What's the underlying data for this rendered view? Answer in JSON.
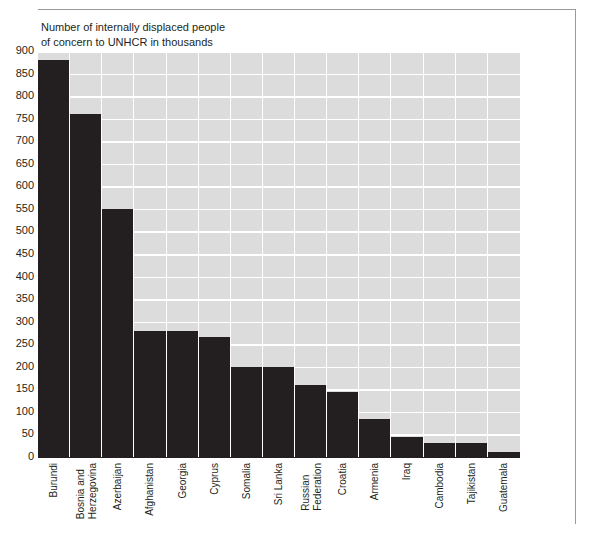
{
  "chart_data": {
    "type": "bar",
    "title": "Number of internally displaced people\nof concern to UNHCR in thousands",
    "xlabel": "",
    "ylabel": "",
    "ylim": [
      0,
      900
    ],
    "ytick_step": 50,
    "grid": true,
    "legend": "none",
    "orientation": "vertical",
    "bar_color": "#231f20",
    "plot_background": "#dcdcdc",
    "gridline_color": "#ffffff",
    "yticks": [
      "900",
      "850",
      "800",
      "750",
      "700",
      "650",
      "600",
      "550",
      "500",
      "450",
      "400",
      "350",
      "300",
      "250",
      "200",
      "150",
      "100",
      "50",
      "0"
    ],
    "categories": [
      "Burundi",
      "Bosnia and Herzegovina",
      "Azerbaijan",
      "Afghanistan",
      "Georgia",
      "Cyprus",
      "Somalia",
      "Sri Lanka",
      "Russian Federation",
      "Croatia",
      "Armenia",
      "Iraq",
      "Cambodia",
      "Tajikistan",
      "Guatemala"
    ],
    "category_lines": [
      [
        "Burundi"
      ],
      [
        "Bosnia and",
        "Herzegovina"
      ],
      [
        "Azerbaijan"
      ],
      [
        "Afghanistan"
      ],
      [
        "Georgia"
      ],
      [
        "Cyprus"
      ],
      [
        "Somalia"
      ],
      [
        "Sri Lanka"
      ],
      [
        "Russian",
        "Federation"
      ],
      [
        "Croatia"
      ],
      [
        "Armenia"
      ],
      [
        "Iraq"
      ],
      [
        "Cambodia"
      ],
      [
        "Tajikistan"
      ],
      [
        "Guatemala"
      ]
    ],
    "values": [
      880,
      760,
      550,
      280,
      280,
      265,
      200,
      200,
      160,
      145,
      85,
      45,
      32,
      30,
      12
    ]
  }
}
